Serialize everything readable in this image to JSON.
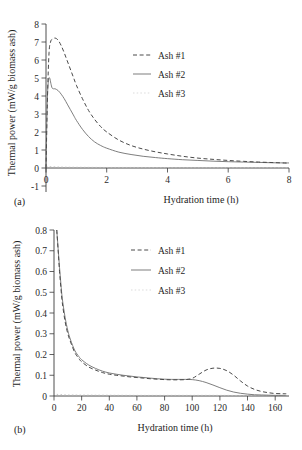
{
  "figure": {
    "panel_a_label": "(a)",
    "panel_b_label": "(b)"
  },
  "chart_data": [
    {
      "type": "line",
      "panel": "(a)",
      "title": "",
      "xlabel": "Hydration time (h)",
      "ylabel": "Thermal power (mW/g biomass ash)",
      "xlim": [
        0,
        8
      ],
      "ylim": [
        -1,
        8
      ],
      "xticks": [
        0,
        2,
        4,
        6,
        8
      ],
      "xticklabels": [
        "0",
        "2",
        "4",
        "6",
        "8"
      ],
      "yticks": [
        -1,
        0,
        1,
        2,
        3,
        4,
        5,
        6,
        7,
        8
      ],
      "yticklabels": [
        "-1",
        "0",
        "1",
        "2",
        "3",
        "4",
        "5",
        "6",
        "7",
        "8"
      ],
      "grid": false,
      "legend_position": "upper-center-right",
      "series": [
        {
          "name": "Ash #1",
          "style": "dashed",
          "color": "#4a4a4a",
          "x": [
            0,
            0.05,
            0.1,
            0.15,
            0.2,
            0.3,
            0.4,
            0.5,
            0.6,
            0.7,
            0.8,
            0.9,
            1.0,
            1.2,
            1.4,
            1.6,
            1.8,
            2.0,
            2.4,
            2.8,
            3.2,
            3.6,
            4.0,
            4.5,
            5.0,
            5.5,
            6.0,
            6.5,
            7.0,
            7.5,
            8.0
          ],
          "y": [
            0.0,
            4.0,
            6.4,
            7.0,
            7.15,
            7.22,
            7.1,
            6.8,
            6.4,
            5.95,
            5.5,
            5.05,
            4.6,
            3.85,
            3.2,
            2.7,
            2.3,
            2.0,
            1.55,
            1.25,
            1.05,
            0.9,
            0.78,
            0.65,
            0.55,
            0.48,
            0.42,
            0.37,
            0.33,
            0.3,
            0.27
          ]
        },
        {
          "name": "Ash #2",
          "style": "solid",
          "color": "#777777",
          "x": [
            0,
            0.04,
            0.08,
            0.12,
            0.16,
            0.2,
            0.25,
            0.3,
            0.4,
            0.5,
            0.6,
            0.7,
            0.8,
            0.9,
            1.0,
            1.2,
            1.4,
            1.6,
            1.8,
            2.0,
            2.4,
            2.8,
            3.2,
            3.6,
            4.0,
            4.5,
            5.0,
            5.5,
            6.0,
            6.5,
            7.0,
            7.5,
            8.0
          ],
          "y": [
            0.0,
            3.6,
            4.85,
            5.0,
            4.7,
            4.45,
            4.4,
            4.4,
            4.3,
            4.1,
            3.85,
            3.55,
            3.25,
            2.95,
            2.65,
            2.15,
            1.75,
            1.45,
            1.25,
            1.1,
            0.88,
            0.75,
            0.65,
            0.58,
            0.52,
            0.46,
            0.42,
            0.38,
            0.35,
            0.33,
            0.31,
            0.29,
            0.28
          ]
        },
        {
          "name": "Ash #3",
          "style": "dotted",
          "color": "#b9b9b9",
          "x": [
            0,
            0.5,
            1.0,
            2.0,
            3.0,
            4.0,
            5.0,
            6.0,
            7.0,
            8.0
          ],
          "y": [
            0.08,
            0.05,
            0.04,
            0.03,
            0.03,
            0.02,
            0.02,
            0.02,
            0.02,
            0.02
          ]
        }
      ]
    },
    {
      "type": "line",
      "panel": "(b)",
      "title": "",
      "xlabel": "Hydration time (h)",
      "ylabel": "Thermal power (mW/g biomass ash)",
      "xlim": [
        0,
        170
      ],
      "ylim": [
        0,
        0.8
      ],
      "xticks": [
        0,
        20,
        40,
        60,
        80,
        100,
        120,
        140,
        160
      ],
      "xticklabels": [
        "0",
        "20",
        "40",
        "60",
        "80",
        "100",
        "120",
        "140",
        "160"
      ],
      "yticks": [
        0,
        0.1,
        0.2,
        0.3,
        0.4,
        0.5,
        0.6,
        0.7,
        0.8
      ],
      "yticklabels": [
        "0",
        "0.1",
        "0.2",
        "0.3",
        "0.4",
        "0.5",
        "0.6",
        "0.7",
        "0.8"
      ],
      "grid": false,
      "legend_position": "upper-center-right",
      "series": [
        {
          "name": "Ash #1",
          "style": "dashed",
          "color": "#4a4a4a",
          "x": [
            2,
            3,
            4,
            5,
            6,
            8,
            10,
            12,
            15,
            18,
            20,
            25,
            30,
            35,
            40,
            45,
            50,
            55,
            60,
            65,
            70,
            75,
            80,
            85,
            90,
            95,
            100,
            105,
            110,
            115,
            120,
            125,
            130,
            135,
            140,
            145,
            150,
            155,
            160,
            165,
            168
          ],
          "y": [
            0.8,
            0.7,
            0.6,
            0.52,
            0.45,
            0.36,
            0.3,
            0.26,
            0.21,
            0.18,
            0.165,
            0.14,
            0.125,
            0.113,
            0.105,
            0.1,
            0.096,
            0.092,
            0.089,
            0.086,
            0.083,
            0.081,
            0.079,
            0.078,
            0.078,
            0.079,
            0.085,
            0.105,
            0.125,
            0.134,
            0.133,
            0.122,
            0.1,
            0.072,
            0.048,
            0.032,
            0.022,
            0.016,
            0.012,
            0.011,
            0.011
          ]
        },
        {
          "name": "Ash #2",
          "style": "solid",
          "color": "#777777",
          "x": [
            2,
            3,
            4,
            5,
            6,
            8,
            10,
            12,
            15,
            18,
            20,
            25,
            30,
            35,
            40,
            45,
            50,
            55,
            60,
            65,
            70,
            75,
            80,
            85,
            90,
            95,
            100,
            105,
            110,
            115,
            120,
            125,
            130,
            135,
            140,
            145,
            150,
            155,
            160,
            165,
            168
          ],
          "y": [
            0.8,
            0.71,
            0.62,
            0.54,
            0.47,
            0.38,
            0.315,
            0.27,
            0.22,
            0.19,
            0.175,
            0.15,
            0.133,
            0.12,
            0.111,
            0.105,
            0.1,
            0.096,
            0.092,
            0.089,
            0.086,
            0.083,
            0.081,
            0.08,
            0.08,
            0.08,
            0.079,
            0.074,
            0.065,
            0.053,
            0.04,
            0.028,
            0.019,
            0.013,
            0.009,
            0.006,
            0.005,
            0.004,
            0.003,
            0.003,
            0.003
          ]
        },
        {
          "name": "Ash #3",
          "style": "dotted",
          "color": "#b9b9b9",
          "x": [
            2,
            10,
            30,
            60,
            90,
            120,
            150,
            168
          ],
          "y": [
            0.008,
            0.005,
            0.004,
            0.003,
            0.003,
            0.003,
            0.002,
            0.002
          ]
        }
      ]
    }
  ],
  "legend_a": {
    "items": [
      {
        "label": "Ash #1",
        "style": "dashed"
      },
      {
        "label": "Ash #2",
        "style": "solid"
      },
      {
        "label": "Ash #3",
        "style": "dotted"
      }
    ]
  },
  "legend_b": {
    "items": [
      {
        "label": "Ash #1",
        "style": "dashed"
      },
      {
        "label": "Ash #2",
        "style": "solid"
      },
      {
        "label": "Ash #3",
        "style": "dotted"
      }
    ]
  }
}
